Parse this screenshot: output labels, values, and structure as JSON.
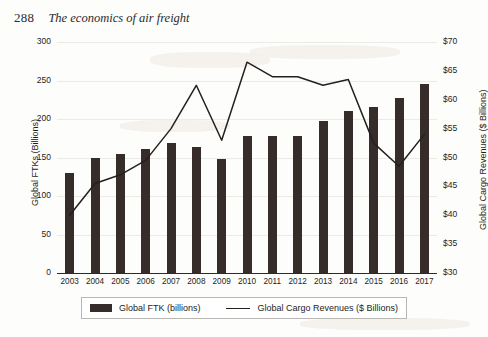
{
  "page": {
    "folio": "288",
    "running_title": "The economics of air freight"
  },
  "chart_data": {
    "type": "bar",
    "title": "",
    "subtitle": "",
    "xlabel": "",
    "ylabel": "Global FTKs (Billions)",
    "y2label": "Global Cargo Revenues ($ Billions)",
    "grid": true,
    "legend_position": "bottom",
    "categories": [
      "2003",
      "2004",
      "2005",
      "2006",
      "2007",
      "2008",
      "2009",
      "2010",
      "2011",
      "2012",
      "2013",
      "2014",
      "2015",
      "2016",
      "2017"
    ],
    "ylim": [
      0,
      300
    ],
    "yticks": [
      "0",
      "50",
      "100",
      "150",
      "200",
      "250",
      "300"
    ],
    "y2lim": [
      30,
      70
    ],
    "y2ticks": [
      "$30",
      "$35",
      "$40",
      "$45",
      "$50",
      "$55",
      "$60",
      "$65",
      "$70"
    ],
    "series": [
      {
        "name": "Global FTK (billions)",
        "render": "bar",
        "axis": "left",
        "color": "#362c29",
        "values": [
          130,
          150,
          155,
          161,
          169,
          163,
          148,
          178,
          178,
          178,
          198,
          211,
          216,
          227,
          246
        ]
      },
      {
        "name": "Global Cargo Revenues ($ Billions)",
        "render": "line",
        "axis": "right",
        "color": "#23201e",
        "values": [
          40.0,
          45.5,
          47.0,
          49.5,
          55.0,
          62.5,
          53.0,
          66.5,
          64.0,
          64.0,
          62.5,
          63.5,
          52.5,
          48.5,
          54.0
        ]
      }
    ],
    "legend": [
      {
        "label": "Global FTK (billions)",
        "marker": "bar-swatch"
      },
      {
        "label": "Global Cargo Revenues ($ Billions)",
        "marker": "line-swatch"
      }
    ]
  }
}
